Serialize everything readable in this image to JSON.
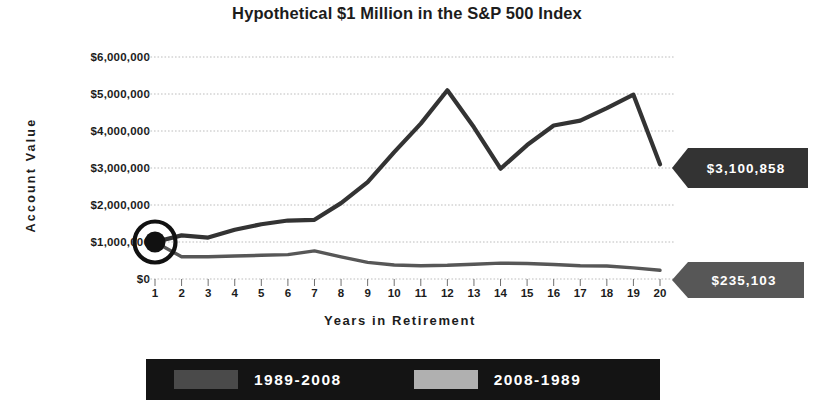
{
  "chart_data": {
    "type": "line",
    "title": "Hypothetical $1 Million in the S&P 500 Index",
    "xlabel": "Years in Retirement",
    "ylabel": "Account Value",
    "grid": true,
    "legend_position": "bottom",
    "xlim": [
      1,
      20
    ],
    "ylim": [
      0,
      6000000
    ],
    "x": [
      1,
      2,
      3,
      4,
      5,
      6,
      7,
      8,
      9,
      10,
      11,
      12,
      13,
      14,
      15,
      16,
      17,
      18,
      19,
      20
    ],
    "categories": [
      "1",
      "2",
      "3",
      "4",
      "5",
      "6",
      "7",
      "8",
      "9",
      "10",
      "11",
      "12",
      "13",
      "14",
      "15",
      "16",
      "17",
      "18",
      "19",
      "20"
    ],
    "ytick_labels": [
      "$6,000,000",
      "$5,000,000",
      "$4,000,000",
      "$3,000,000",
      "$2,000,000",
      "$1,000,000",
      "$0"
    ],
    "ytick_values": [
      6000000,
      5000000,
      4000000,
      3000000,
      2000000,
      1000000,
      0
    ],
    "series": [
      {
        "name": "1989-2008",
        "color": "#333333",
        "values": [
          1000000,
          1180000,
          1120000,
          1330000,
          1480000,
          1580000,
          1600000,
          2050000,
          2620000,
          3430000,
          4200000,
          5100000,
          4100000,
          2980000,
          3620000,
          4150000,
          4280000,
          4620000,
          4980000,
          3100858
        ]
      },
      {
        "name": "2008-1989",
        "color": "#575757",
        "values": [
          1000000,
          600000,
          600000,
          620000,
          640000,
          660000,
          760000,
          600000,
          450000,
          380000,
          360000,
          370000,
          400000,
          430000,
          420000,
          390000,
          360000,
          350000,
          300000,
          235103
        ]
      }
    ],
    "annotations": [
      {
        "name": "end-value-high",
        "label": "$3,100,858",
        "value": 3100858,
        "x": 20,
        "series": "1989-2008"
      },
      {
        "name": "end-value-low",
        "label": "$235,103",
        "value": 235103,
        "x": 20,
        "series": "2008-1989"
      },
      {
        "name": "start-marker",
        "label": "",
        "value": 1000000,
        "x": 1
      }
    ]
  },
  "legend": {
    "entries": [
      {
        "label": "1989-2008",
        "color": "#4a4a4a"
      },
      {
        "label": "2008-1989",
        "color": "#b0b0b0"
      }
    ],
    "background": "#141414"
  },
  "colors": {
    "high_callout": "#333333",
    "low_callout": "#575757",
    "line_high": "#333333",
    "line_low": "#575757",
    "grid": "#bdbdbd",
    "text": "#1c1c1c"
  }
}
